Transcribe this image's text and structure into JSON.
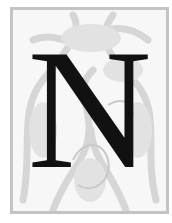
{
  "initial": {
    "letter": "N",
    "letter_color": "#111111",
    "border_color": "#c4c4c4",
    "ornament_color": "#d6d6d6",
    "background_color": "#f7f7f7"
  }
}
